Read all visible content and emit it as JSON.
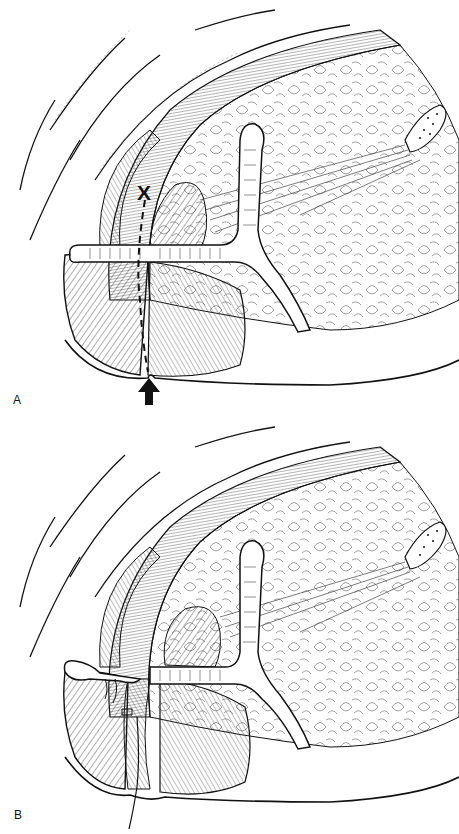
{
  "figure": {
    "panels": [
      {
        "label": "A",
        "description": "Anatomical cross-section line drawing with dashed incision line, X marker and upward arrow",
        "annotations": {
          "marker": "X",
          "arrow": "up-arrow"
        }
      },
      {
        "label": "B",
        "description": "Same anatomical section after repair, with suture thread extending downward",
        "annotations": {
          "suture": "suture-thread"
        }
      }
    ],
    "colors": {
      "ink": "#111111",
      "background": "#ffffff"
    }
  }
}
